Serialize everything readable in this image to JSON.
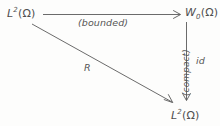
{
  "diagram": {
    "type": "commutative-diagram",
    "title": "",
    "background_color": "#fdfdfc",
    "ink_color": "#5a5a5a",
    "nodes": [
      {
        "id": "source",
        "position": "top-left",
        "base": "L",
        "superscript": "2",
        "subscript": "",
        "argument": "(Ω)",
        "full_text": "L²(Ω)"
      },
      {
        "id": "middle",
        "position": "top-right",
        "base": "W",
        "superscript": "",
        "subscript": "0",
        "argument": "(Ω)",
        "full_text": "W₀(Ω)"
      },
      {
        "id": "target",
        "position": "bottom-right",
        "base": "L",
        "superscript": "2",
        "subscript": "",
        "argument": "(Ω)",
        "full_text": "L²(Ω)"
      }
    ],
    "edges": [
      {
        "id": "horizontal",
        "from": "source",
        "to": "middle",
        "label": "(bounded)",
        "orientation": "horizontal",
        "arrowhead": "open"
      },
      {
        "id": "vertical",
        "from": "middle",
        "to": "target",
        "label": "(compact)",
        "label_secondary": "id",
        "orientation": "vertical",
        "arrowhead": "open"
      },
      {
        "id": "diagonal",
        "from": "source",
        "to": "target",
        "label": "R",
        "orientation": "diagonal",
        "arrowhead": "open"
      }
    ]
  }
}
